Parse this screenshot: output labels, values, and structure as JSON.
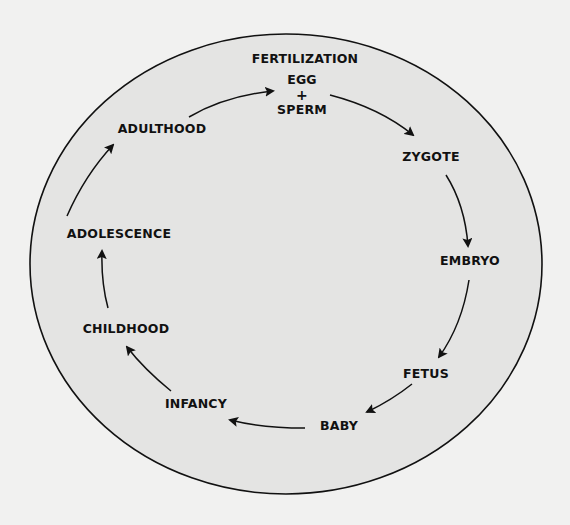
{
  "diagram": {
    "colors": {
      "background": "#f1f1f0",
      "ellipse_fill": "#e4e4e3",
      "stroke": "#111111"
    },
    "stages": [
      {
        "id": "fertilization",
        "label": "FERTILIZATION",
        "x": 305,
        "y": 59
      },
      {
        "id": "egg",
        "label": "EGG",
        "x": 302,
        "y": 80
      },
      {
        "id": "plus",
        "label": "+",
        "x": 302,
        "y": 95
      },
      {
        "id": "sperm",
        "label": "SPERM",
        "x": 302,
        "y": 110
      },
      {
        "id": "zygote",
        "label": "ZYGOTE",
        "x": 431,
        "y": 157
      },
      {
        "id": "embryo",
        "label": "EMBRYO",
        "x": 470,
        "y": 261
      },
      {
        "id": "fetus",
        "label": "FETUS",
        "x": 426,
        "y": 374
      },
      {
        "id": "baby",
        "label": "BABY",
        "x": 339,
        "y": 426
      },
      {
        "id": "infancy",
        "label": "INFANCY",
        "x": 196,
        "y": 404
      },
      {
        "id": "childhood",
        "label": "CHILDHOOD",
        "x": 126,
        "y": 329
      },
      {
        "id": "adolescence",
        "label": "ADOLESCENCE",
        "x": 119,
        "y": 234
      },
      {
        "id": "adulthood",
        "label": "ADULTHOOD",
        "x": 162,
        "y": 129
      }
    ],
    "arrows": [
      {
        "from": "adulthood",
        "to": "egg"
      },
      {
        "from": "sperm",
        "to": "zygote"
      },
      {
        "from": "zygote",
        "to": "embryo"
      },
      {
        "from": "embryo",
        "to": "fetus"
      },
      {
        "from": "fetus",
        "to": "baby"
      },
      {
        "from": "baby",
        "to": "infancy"
      },
      {
        "from": "infancy",
        "to": "childhood"
      },
      {
        "from": "childhood",
        "to": "adolescence"
      },
      {
        "from": "adolescence",
        "to": "adulthood"
      }
    ]
  }
}
